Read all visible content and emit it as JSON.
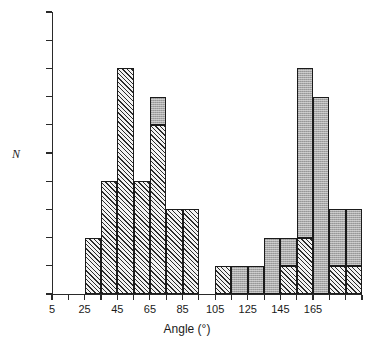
{
  "chart_data": {
    "type": "bar",
    "title": "",
    "subtitle": "",
    "xlabel": "Angle (°)",
    "ylabel": "N",
    "xlim": [
      5,
      195
    ],
    "ylim": [
      0,
      10
    ],
    "grid": false,
    "legend": null,
    "bin_width": 10,
    "x_ticks": [
      5,
      25,
      45,
      65,
      85,
      105,
      125,
      145,
      165
    ],
    "x_tick_labels": [
      "5",
      "25",
      "45",
      "65",
      "85",
      "105",
      "125",
      "145",
      "165"
    ],
    "y_ticks": [
      0,
      1,
      2,
      3,
      4,
      5,
      6,
      7,
      8,
      9,
      10
    ],
    "y_tick_labels": [
      "0",
      "1",
      "2",
      "3",
      "4",
      "5",
      "6",
      "7",
      "8",
      "9",
      "10"
    ],
    "series": [
      {
        "name": "hatched",
        "fill": "diagonal-hatch"
      },
      {
        "name": "shaded",
        "fill": "solid-grey"
      }
    ],
    "bars": [
      {
        "bin_start": 25,
        "bin_end": 35,
        "total": 2,
        "hatched": 2,
        "shaded": 0
      },
      {
        "bin_start": 35,
        "bin_end": 45,
        "total": 4,
        "hatched": 4,
        "shaded": 0
      },
      {
        "bin_start": 45,
        "bin_end": 55,
        "total": 8,
        "hatched": 8,
        "shaded": 0
      },
      {
        "bin_start": 55,
        "bin_end": 65,
        "total": 4,
        "hatched": 4,
        "shaded": 0
      },
      {
        "bin_start": 65,
        "bin_end": 75,
        "total": 7,
        "hatched": 6,
        "shaded": 1
      },
      {
        "bin_start": 75,
        "bin_end": 85,
        "total": 3,
        "hatched": 3,
        "shaded": 0
      },
      {
        "bin_start": 85,
        "bin_end": 95,
        "total": 3,
        "hatched": 3,
        "shaded": 0
      },
      {
        "bin_start": 105,
        "bin_end": 115,
        "total": 1,
        "hatched": 1,
        "shaded": 0
      },
      {
        "bin_start": 115,
        "bin_end": 125,
        "total": 1,
        "hatched": 0,
        "shaded": 1
      },
      {
        "bin_start": 125,
        "bin_end": 135,
        "total": 1,
        "hatched": 0,
        "shaded": 1
      },
      {
        "bin_start": 135,
        "bin_end": 145,
        "total": 2,
        "hatched": 0,
        "shaded": 2
      },
      {
        "bin_start": 145,
        "bin_end": 155,
        "total": 2,
        "hatched": 1,
        "shaded": 1
      },
      {
        "bin_start": 155,
        "bin_end": 165,
        "total": 8,
        "hatched": 2,
        "shaded": 6
      },
      {
        "bin_start": 165,
        "bin_end": 175,
        "total": 7,
        "hatched": 0,
        "shaded": 7
      },
      {
        "bin_start": 175,
        "bin_end": 185,
        "total": 3,
        "hatched": 1,
        "shaded": 2
      },
      {
        "bin_start": 185,
        "bin_end": 195,
        "total": 3,
        "hatched": 1,
        "shaded": 2
      }
    ],
    "colors": {
      "axis": "#2a2a2a",
      "bar_outline": "#1b1b1b",
      "hatch_fill": "#f2f2f2",
      "hatch_line": "#2b2b2b",
      "shaded_fill": "#a8a8a8",
      "background": "#ffffff"
    }
  }
}
